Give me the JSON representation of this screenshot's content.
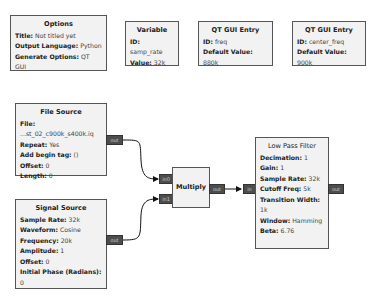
{
  "blocks": {
    "options": {
      "title": "Options",
      "params": [
        {
          "label": "Title:",
          "value": "Not titled yet"
        },
        {
          "label": "Output Language:",
          "value": "Python"
        },
        {
          "label": "Generate Options:",
          "value": "QT GUI"
        }
      ]
    },
    "variable": {
      "title": "Variable",
      "params": [
        {
          "label": "ID:",
          "value": "samp_rate"
        },
        {
          "label": "Value:",
          "value": "32k"
        }
      ]
    },
    "qt_entry_freq": {
      "title": "QT GUI Entry",
      "params": [
        {
          "label": "ID:",
          "value": "freq"
        },
        {
          "label": "Default Value:",
          "value": "880k"
        }
      ]
    },
    "qt_entry_center": {
      "title": "QT GUI Entry",
      "params": [
        {
          "label": "ID:",
          "value": "center_freq"
        },
        {
          "label": "Default Value:",
          "value": "900k"
        }
      ]
    },
    "file_source": {
      "title": "File Source",
      "params": [
        {
          "label": "File:",
          "value": "...st_02_c900k_s400k.iq"
        },
        {
          "label": "Repeat:",
          "value": "Yes"
        },
        {
          "label": "Add begin tag:",
          "value": "()"
        },
        {
          "label": "Offset:",
          "value": "0"
        },
        {
          "label": "Length:",
          "value": "0"
        }
      ],
      "ports": {
        "out": "out"
      }
    },
    "signal_source": {
      "title": "Signal Source",
      "params": [
        {
          "label": "Sample Rate:",
          "value": "32k"
        },
        {
          "label": "Waveform:",
          "value": "Cosine"
        },
        {
          "label": "Frequency:",
          "value": "20k"
        },
        {
          "label": "Amplitude:",
          "value": "1"
        },
        {
          "label": "Offset:",
          "value": "0"
        },
        {
          "label": "Initial Phase (Radians):",
          "value": "0"
        }
      ],
      "ports": {
        "out": "out"
      }
    },
    "multiply": {
      "title": "Multiply",
      "ports": {
        "in0": "in0",
        "in1": "in1",
        "out": "out"
      }
    },
    "low_pass_filter": {
      "title": "Low Pass Filter",
      "params": [
        {
          "label": "Decimation:",
          "value": "1"
        },
        {
          "label": "Gain:",
          "value": "1"
        },
        {
          "label": "Sample Rate:",
          "value": "32k"
        },
        {
          "label": "Cutoff Freq:",
          "value": "5k"
        },
        {
          "label": "Transition Width:",
          "value": "1k"
        },
        {
          "label": "Window:",
          "value": "Hamming"
        },
        {
          "label": "Beta:",
          "value": "6.76"
        }
      ],
      "ports": {
        "in": "in",
        "out": "out"
      }
    }
  },
  "connections": [
    {
      "from": "File Source.out",
      "to": "Multiply.in0"
    },
    {
      "from": "Signal Source.out",
      "to": "Multiply.in1"
    },
    {
      "from": "Multiply.out",
      "to": "Low Pass Filter.in"
    }
  ]
}
